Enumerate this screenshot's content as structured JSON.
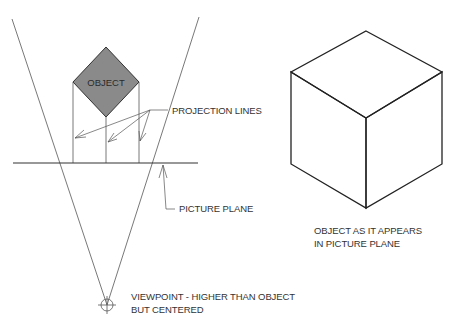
{
  "diagram": {
    "object_label": "OBJECT",
    "projection_lines_label": "PROJECTION LINES",
    "picture_plane_label": "PICTURE PLANE",
    "result_label": {
      "line1": "OBJECT AS IT APPEARS",
      "line2": "IN PICTURE PLANE"
    },
    "viewpoint_label": {
      "line1": "VIEWPOINT - HIGHER THAN OBJECT",
      "line2": "BUT CENTERED"
    },
    "colors": {
      "object_fill": "#8a8a8a",
      "line": "#333333",
      "background": "#ffffff"
    }
  }
}
